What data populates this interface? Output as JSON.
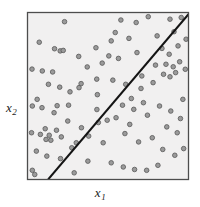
{
  "figure": {
    "name": "scatter-plot-with-decision-boundary",
    "background_color": "#ffffff"
  },
  "axes": {
    "x_label": "x",
    "x_subscript": "1",
    "y_label": "x",
    "y_subscript": "2",
    "frame_color": "#4d4d4d",
    "plot_background": "#f1f0f0"
  },
  "chart_data": {
    "type": "scatter",
    "title": "",
    "xlabel": "x1",
    "ylabel": "x2",
    "xlim": [
      0,
      100
    ],
    "ylim": [
      0,
      100
    ],
    "grid": false,
    "legend": null,
    "marker": {
      "shape": "circle",
      "fill_color": "#9a9a9a",
      "edge_color": "#585858",
      "size_px": 4.6
    },
    "annotations": [
      {
        "type": "line",
        "name": "decision-boundary",
        "color": "#141414",
        "width_px": 2.0,
        "x0": 12.8,
        "y0": 0,
        "x1": 100,
        "y1": 99.0
      }
    ],
    "series": [
      {
        "name": "points",
        "points": [
          [
            7.3,
            82.2
          ],
          [
            23.0,
            94.5
          ],
          [
            31.8,
            73.7
          ],
          [
            16.8,
            78.3
          ],
          [
            20.3,
            77.0
          ],
          [
            22.2,
            77.3
          ],
          [
            42.5,
            78.9
          ],
          [
            2.8,
            66.1
          ],
          [
            9.2,
            65.0
          ],
          [
            15.6,
            64.4
          ],
          [
            37.1,
            67.4
          ],
          [
            46.4,
            69.7
          ],
          [
            13.0,
            57.0
          ],
          [
            20.0,
            55.3
          ],
          [
            26.4,
            52.5
          ],
          [
            33.3,
            57.4
          ],
          [
            43.0,
            60.1
          ],
          [
            43.4,
            50.8
          ],
          [
            18.4,
            44.2
          ],
          [
            43.1,
            41.9
          ],
          [
            44.0,
            34.1
          ],
          [
            11.0,
            30.4
          ],
          [
            30.3,
            22.0
          ],
          [
            32.0,
            55.0
          ],
          [
            25.0,
            35.0
          ],
          [
            6.0,
            48.0
          ],
          [
            3.0,
            44.0
          ],
          [
            9.0,
            43.0
          ],
          [
            16.5,
            40.0
          ],
          [
            2.5,
            28.0
          ],
          [
            8.0,
            27.0
          ],
          [
            13.5,
            26.5
          ],
          [
            18.0,
            29.5
          ],
          [
            11.5,
            24.0
          ],
          [
            14.5,
            23.5
          ],
          [
            21.0,
            25.5
          ],
          [
            5.5,
            17.0
          ],
          [
            12.0,
            14.0
          ],
          [
            20.5,
            12.5
          ],
          [
            27.5,
            19.0
          ],
          [
            3.0,
            5.5
          ],
          [
            4.5,
            3.0
          ],
          [
            29.0,
            4.0
          ],
          [
            37.5,
            11.0
          ],
          [
            33.5,
            31.0
          ],
          [
            38.0,
            26.0
          ],
          [
            25.5,
            44.5
          ],
          [
            58.0,
            95.5
          ],
          [
            54.5,
            88.0
          ],
          [
            67.5,
            94.0
          ],
          [
            75.0,
            97.5
          ],
          [
            88.5,
            96.0
          ],
          [
            95.5,
            97.0
          ],
          [
            52.0,
            83.0
          ],
          [
            63.0,
            84.5
          ],
          [
            80.5,
            86.0
          ],
          [
            91.0,
            88.5
          ],
          [
            50.5,
            74.0
          ],
          [
            56.5,
            72.5
          ],
          [
            68.0,
            76.0
          ],
          [
            83.5,
            78.5
          ],
          [
            88.0,
            75.0
          ],
          [
            93.5,
            80.0
          ],
          [
            86.0,
            69.0
          ],
          [
            90.5,
            67.5
          ],
          [
            94.5,
            70.5
          ],
          [
            84.5,
            63.0
          ],
          [
            88.5,
            61.5
          ],
          [
            92.0,
            64.0
          ],
          [
            98.0,
            66.0
          ],
          [
            53.0,
            59.5
          ],
          [
            61.0,
            57.0
          ],
          [
            70.5,
            54.5
          ],
          [
            78.0,
            58.0
          ],
          [
            64.5,
            48.5
          ],
          [
            72.0,
            46.0
          ],
          [
            59.0,
            44.5
          ],
          [
            66.0,
            42.0
          ],
          [
            74.5,
            38.5
          ],
          [
            82.0,
            44.0
          ],
          [
            89.0,
            41.0
          ],
          [
            95.0,
            36.5
          ],
          [
            86.5,
            31.5
          ],
          [
            93.0,
            28.0
          ],
          [
            77.5,
            25.0
          ],
          [
            69.0,
            22.5
          ],
          [
            60.5,
            27.5
          ],
          [
            84.0,
            18.0
          ],
          [
            91.5,
            14.5
          ],
          [
            52.0,
            10.0
          ],
          [
            59.5,
            7.5
          ],
          [
            66.5,
            6.0
          ],
          [
            74.0,
            5.5
          ],
          [
            81.0,
            8.5
          ],
          [
            97.0,
            18.5
          ],
          [
            47.0,
            22.0
          ],
          [
            49.5,
            35.5
          ],
          [
            55.0,
            37.0
          ],
          [
            63.5,
            33.0
          ],
          [
            71.0,
            62.0
          ],
          [
            79.5,
            68.5
          ],
          [
            96.5,
            48.0
          ],
          [
            98.5,
            84.0
          ]
        ]
      }
    ]
  }
}
